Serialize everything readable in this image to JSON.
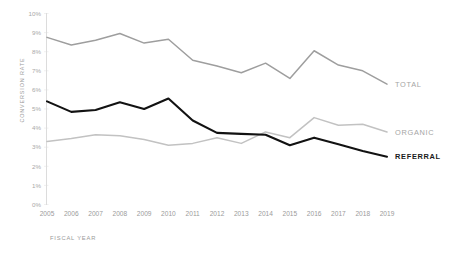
{
  "chart_data": {
    "type": "line",
    "title": "",
    "xlabel": "FISCAL YEAR",
    "ylabel": "CONVERSION RATE",
    "x": [
      2005,
      2006,
      2007,
      2008,
      2009,
      2010,
      2011,
      2012,
      2013,
      2014,
      2015,
      2016,
      2017,
      2018,
      2019
    ],
    "categories": [
      "2005",
      "2006",
      "2007",
      "2008",
      "2009",
      "2010",
      "2011",
      "2012",
      "2013",
      "2014",
      "2015",
      "2016",
      "2017",
      "2018",
      "2019"
    ],
    "ytick_labels": [
      "0%",
      "1%",
      "2%",
      "3%",
      "4%",
      "5%",
      "6%",
      "7%",
      "8%",
      "9%",
      "10%"
    ],
    "ytick_values": [
      0,
      1,
      2,
      3,
      4,
      5,
      6,
      7,
      8,
      9,
      10
    ],
    "ylim": [
      0,
      10
    ],
    "xlim": [
      2005,
      2019
    ],
    "grid": true,
    "legend_position": "right-inline",
    "series": [
      {
        "name": "TOTAL",
        "color": "#9e9e9e",
        "values": [
          8.75,
          8.35,
          8.6,
          8.95,
          8.45,
          8.65,
          7.55,
          7.25,
          6.9,
          7.4,
          6.6,
          8.05,
          7.3,
          7.0,
          6.3
        ]
      },
      {
        "name": "ORGANIC",
        "color": "#c2c2c2",
        "values": [
          3.3,
          3.45,
          3.65,
          3.6,
          3.4,
          3.1,
          3.2,
          3.5,
          3.2,
          3.8,
          3.5,
          4.55,
          4.15,
          4.2,
          3.8
        ]
      },
      {
        "name": "REFERRAL",
        "color": "#121212",
        "values": [
          5.4,
          4.85,
          4.95,
          5.35,
          5.0,
          5.55,
          4.4,
          3.75,
          3.7,
          3.65,
          3.1,
          3.5,
          3.15,
          2.8,
          2.5
        ]
      }
    ]
  },
  "labels": {
    "yaxis_title": "CONVERSION RATE",
    "xaxis_title": "FISCAL YEAR",
    "total": "TOTAL",
    "organic": "ORGANIC",
    "referral": "REFERRAL"
  },
  "colors": {
    "total": "#9e9e9e",
    "organic": "#c2c2c2",
    "referral": "#121212",
    "grid": "#e9e9e9",
    "axis": "#dcdcdc",
    "tick_text": "#a8a8a8",
    "background": "#ffffff"
  }
}
